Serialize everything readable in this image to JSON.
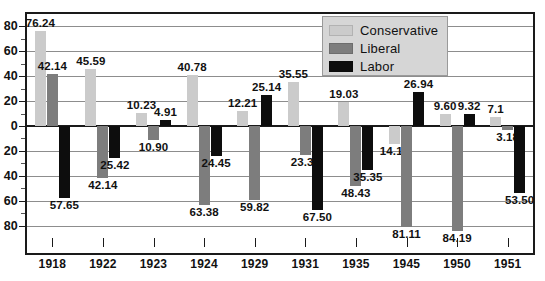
{
  "chart_data": {
    "type": "bar",
    "title": "",
    "xlabel": "",
    "ylabel": "",
    "grid": true,
    "legend_position": "top-right",
    "ylim": [
      -90,
      90
    ],
    "y_ticks": [
      "80",
      "60",
      "40",
      "20",
      "0",
      "20",
      "40",
      "60",
      "80"
    ],
    "y_tick_values": [
      80,
      60,
      40,
      20,
      0,
      -20,
      -40,
      -60,
      -80
    ],
    "categories": [
      "1918",
      "1922",
      "1923",
      "1924",
      "1929",
      "1931",
      "1935",
      "1945",
      "1950",
      "1951"
    ],
    "series": [
      {
        "name": "Conservative",
        "color": "#cbcbcb",
        "values": [
          76.24,
          45.59,
          10.23,
          40.78,
          12.21,
          35.55,
          19.03,
          -14.13,
          9.6,
          7.1
        ],
        "labels": [
          "76.24",
          "45.59",
          "10.23",
          "40.78",
          "12.21",
          "35.55",
          "19.03",
          "14.13",
          "9.60",
          "7.1"
        ]
      },
      {
        "name": "Liberal",
        "color": "#7d7d7d",
        "values": [
          42.14,
          -42.14,
          -10.9,
          -63.38,
          -59.82,
          -23.37,
          -48.43,
          -81.11,
          -84.19,
          -3.18
        ],
        "labels": [
          "42.14",
          "42.14",
          "10.90",
          "63.38",
          "59.82",
          "23.37",
          "48.43",
          "81.11",
          "84.19",
          "3.18"
        ]
      },
      {
        "name": "Labor",
        "color": "#0d0d0d",
        "values": [
          -57.65,
          -25.42,
          4.91,
          -24.45,
          25.14,
          -67.5,
          -35.35,
          26.94,
          9.32,
          -53.5
        ],
        "labels": [
          "57.65",
          "25.42",
          "4.91",
          "24.45",
          "25.14",
          "67.50",
          "35.35",
          "26.94",
          "9.32",
          "53.50"
        ]
      }
    ]
  },
  "legend": {
    "items": [
      {
        "label": "Conservative",
        "color": "#cbcbcb"
      },
      {
        "label": "Liberal",
        "color": "#7d7d7d"
      },
      {
        "label": "Labor",
        "color": "#0d0d0d"
      }
    ]
  }
}
